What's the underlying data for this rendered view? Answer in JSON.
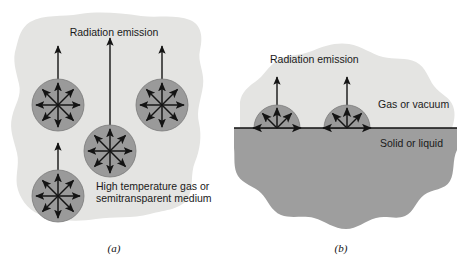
{
  "figure": {
    "name": "radiation-emission-diagram",
    "panels": [
      {
        "id": "a",
        "caption": "(a)",
        "emission_label": "Radiation emission",
        "medium_label_line1": "High temperature gas or",
        "medium_label_line2": "semitransparent medium",
        "emitter_shape": "circle",
        "emitter_count": 4,
        "rays_per_emitter": 8,
        "emitters": [
          {
            "cx": 58,
            "cy": 105,
            "r": 26,
            "beam_top": 46
          },
          {
            "cx": 110,
            "cy": 151,
            "r": 26,
            "beam_top": 38
          },
          {
            "cx": 162,
            "cy": 105,
            "r": 26,
            "beam_top": 46
          },
          {
            "cx": 58,
            "cy": 196,
            "r": 26,
            "beam_top": 143
          }
        ]
      },
      {
        "id": "b",
        "caption": "(b)",
        "emission_label": "Radiation emission",
        "upper_region_label": "Gas or vacuum",
        "lower_region_label": "Solid or liquid",
        "emitter_shape": "hemisphere",
        "emitter_count": 2,
        "rays_per_emitter": 5,
        "interface_y": 128,
        "interface_x_start": 234,
        "interface_x_end": 457,
        "emitters": [
          {
            "cx": 277,
            "cy": 128,
            "r": 23,
            "beam_top": 77
          },
          {
            "cx": 347,
            "cy": 128,
            "r": 23,
            "beam_top": 77
          }
        ]
      }
    ]
  },
  "colors": {
    "background": "#ffffff",
    "medium_blob": "#e4e4e2",
    "solid_region": "#9e9e9e",
    "emitter_fill": "#9a9a9a",
    "emitter_stroke": "#6f6f6f",
    "arrow": "#141414",
    "text": "#1a1a1a",
    "interface_line": "#111111"
  }
}
